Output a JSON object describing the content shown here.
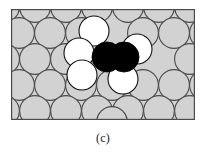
{
  "figure": {
    "caption": "(c)",
    "panel_label": "(c)",
    "title": ""
  },
  "colors": {
    "substrate_atom_fill": "#d2d2d2",
    "substrate_atom_stroke": "#4a4a4a",
    "adatom_fill": "#ffffff",
    "adatom_stroke": "#111111",
    "core_atom_fill": "#000000",
    "core_atom_stroke": "#000000",
    "frame_stroke": "#4a4a4a",
    "panel_background": "#d2d2d2",
    "page_background": "#ffffff",
    "caption_color": "#1a1a1a"
  },
  "panel": {
    "x": 11,
    "y": 9,
    "width": 184,
    "height": 111,
    "frame_width": 1.2
  },
  "chart_data": {
    "type": "scatter",
    "title": "",
    "xlabel": "",
    "ylabel": "",
    "xlim": [
      0,
      184
    ],
    "ylim": [
      0,
      111
    ],
    "grid": false,
    "legend": null,
    "lattice": {
      "packing": "hexagonal-close-packed-2d",
      "atom_radius": 15.4,
      "row_spacing": 26.6,
      "column_spacing": 30.8,
      "rows": 5,
      "row_offsets": [
        0,
        15.4,
        0,
        15.4,
        0
      ]
    },
    "series": [
      {
        "name": "substrate-atoms",
        "role": "substrate",
        "fill": "#d2d2d2",
        "stroke": "#4a4a4a",
        "radius": 15.4,
        "points": [
          [
            -7,
            -2
          ],
          [
            24,
            -2
          ],
          [
            55,
            -2
          ],
          [
            86,
            -2
          ],
          [
            117,
            -2
          ],
          [
            148,
            -2
          ],
          [
            179,
            -2
          ],
          [
            8,
            24
          ],
          [
            39,
            24
          ],
          [
            70,
            24
          ],
          [
            163,
            24
          ],
          [
            194,
            24
          ],
          [
            -7,
            50
          ],
          [
            24,
            50
          ],
          [
            55,
            50
          ],
          [
            179,
            50
          ],
          [
            8,
            76
          ],
          [
            39,
            76
          ],
          [
            70,
            76
          ],
          [
            101,
            76
          ],
          [
            132,
            76
          ],
          [
            163,
            76
          ],
          [
            194,
            76
          ],
          [
            -7,
            102
          ],
          [
            24,
            102
          ],
          [
            55,
            102
          ],
          [
            86,
            102
          ],
          [
            117,
            102
          ],
          [
            148,
            102
          ],
          [
            179,
            102
          ],
          [
            132,
            24
          ],
          [
            101,
            113
          ]
        ]
      },
      {
        "name": "adatoms-white",
        "role": "adsorbed",
        "fill": "#ffffff",
        "stroke": "#111111",
        "radius": 15.0,
        "points": [
          [
            83,
            22
          ],
          [
            68,
            44
          ],
          [
            71,
            66
          ],
          [
            126,
            40
          ],
          [
            112,
            70
          ]
        ]
      },
      {
        "name": "core-atoms-black",
        "role": "defect-core",
        "fill": "#000000",
        "stroke": "#000000",
        "radius": 15.0,
        "points": [
          [
            96,
            48
          ],
          [
            113,
            48
          ]
        ]
      }
    ],
    "annotations": [
      {
        "text": "(c)",
        "x": 92,
        "y": 128,
        "role": "panel-label"
      }
    ]
  }
}
